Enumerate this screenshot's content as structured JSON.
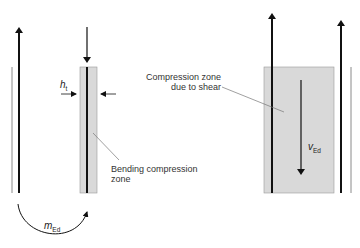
{
  "diagram": {
    "title": "",
    "labels": {
      "shear_zone_line1": "Compression zone",
      "shear_zone_line2": "due to shear",
      "bending_zone_line1": "Bending compression",
      "bending_zone_line2": "zone",
      "ht_symbol": "h",
      "ht_subscript": "t",
      "moment_symbol": "m",
      "moment_subscript": "Ed",
      "shear_symbol": "v",
      "shear_subscript": "Ed"
    },
    "colors": {
      "shading": "#d9d9d9",
      "line": "#111111",
      "thin_line": "#8a8a8a",
      "leader": "#777777"
    }
  }
}
